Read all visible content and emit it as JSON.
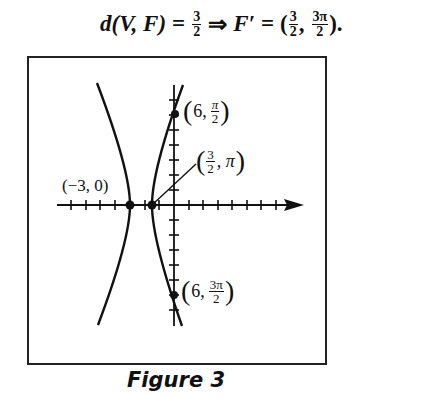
{
  "equation": {
    "lhs": "d(V, F)",
    "equals1": "=",
    "frac1": {
      "num": "3",
      "den": "2"
    },
    "implies": "⇒",
    "rhs_var": "F′",
    "equals2": "=",
    "open_paren": "(",
    "frac2": {
      "num": "3",
      "den": "2"
    },
    "comma": ",",
    "frac3": {
      "num": "3π",
      "den": "2"
    },
    "close": ")."
  },
  "figure": {
    "caption": "Figure 3",
    "axes": {
      "x_axis_y": 205,
      "y_axis_x": 174,
      "x_range_px": [
        57,
        302
      ],
      "y_range_px": [
        85,
        326
      ],
      "x_tick_spacing_px": 14.5,
      "y_tick_spacing_px": 15,
      "arrow": "positive-x"
    },
    "curves": [
      {
        "name": "left-branch",
        "vertex": [
          130,
          205
        ],
        "top": [
          97,
          83
        ],
        "bottom": [
          98,
          325
        ]
      },
      {
        "name": "right-branch",
        "vertex": [
          152,
          205
        ],
        "top": [
          183,
          85
        ],
        "bottom": [
          182,
          326
        ]
      }
    ],
    "points": [
      {
        "id": "p1",
        "label_a": "6",
        "label_frac": {
          "num": "π",
          "den": "2"
        },
        "px": [
          175,
          114
        ]
      },
      {
        "id": "p2",
        "label_frac": {
          "num": "3",
          "den": "2"
        },
        "label_b": "π",
        "px": [
          152,
          205
        ]
      },
      {
        "id": "p3",
        "label": "(−3, 0)",
        "px": [
          130,
          205
        ]
      },
      {
        "id": "p4",
        "label_a": "6",
        "label_frac": {
          "num": "3π",
          "den": "2"
        },
        "px": [
          174,
          295
        ]
      }
    ],
    "labels": {
      "p1_prefix": "6,",
      "p2_suffix": ", π",
      "p3": "(−3, 0)",
      "p4_prefix": "6,",
      "open": "(",
      "close": ")"
    }
  }
}
